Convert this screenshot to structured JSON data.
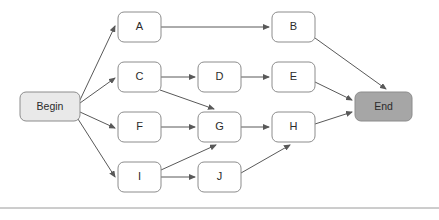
{
  "diagram": {
    "background_color": "#ffffff",
    "divider": {
      "name": "bottom-divider",
      "color": "#9a9a9a",
      "y": 208
    },
    "style": {
      "node_stroke": "#8c8c8c",
      "node_fill_default": "#ffffff",
      "node_fill_begin": "#e9e9e9",
      "node_fill_end": "#a6a6a6",
      "edge_color": "#595959",
      "text_color": "#2b2b2b"
    },
    "nodes": [
      {
        "id": "begin",
        "label": "Begin",
        "x": 20,
        "y": 92,
        "w": 60,
        "h": 29,
        "fill": "#e9e9e9"
      },
      {
        "id": "a",
        "label": "A",
        "x": 118,
        "y": 12,
        "w": 43,
        "h": 30,
        "fill": "#ffffff"
      },
      {
        "id": "b",
        "label": "B",
        "x": 272,
        "y": 12,
        "w": 43,
        "h": 30,
        "fill": "#ffffff"
      },
      {
        "id": "c",
        "label": "C",
        "x": 118,
        "y": 62,
        "w": 43,
        "h": 30,
        "fill": "#ffffff"
      },
      {
        "id": "d",
        "label": "D",
        "x": 198,
        "y": 62,
        "w": 43,
        "h": 30,
        "fill": "#ffffff"
      },
      {
        "id": "e",
        "label": "E",
        "x": 272,
        "y": 62,
        "w": 43,
        "h": 30,
        "fill": "#ffffff"
      },
      {
        "id": "f",
        "label": "F",
        "x": 118,
        "y": 112,
        "w": 43,
        "h": 30,
        "fill": "#ffffff"
      },
      {
        "id": "g",
        "label": "G",
        "x": 198,
        "y": 112,
        "w": 43,
        "h": 30,
        "fill": "#ffffff"
      },
      {
        "id": "h",
        "label": "H",
        "x": 272,
        "y": 112,
        "w": 43,
        "h": 30,
        "fill": "#ffffff"
      },
      {
        "id": "i",
        "label": "I",
        "x": 118,
        "y": 162,
        "w": 43,
        "h": 30,
        "fill": "#ffffff"
      },
      {
        "id": "j",
        "label": "J",
        "x": 198,
        "y": 162,
        "w": 43,
        "h": 30,
        "fill": "#ffffff"
      },
      {
        "id": "end",
        "label": "End",
        "x": 355,
        "y": 92,
        "w": 57,
        "h": 29,
        "fill": "#a6a6a6"
      }
    ],
    "edges": [
      {
        "from": "begin",
        "to": "a",
        "x1": 80,
        "y1": 100,
        "x2": 115,
        "y2": 26
      },
      {
        "from": "begin",
        "to": "c",
        "x1": 80,
        "y1": 103,
        "x2": 115,
        "y2": 78
      },
      {
        "from": "begin",
        "to": "f",
        "x1": 80,
        "y1": 112,
        "x2": 115,
        "y2": 128
      },
      {
        "from": "begin",
        "to": "i",
        "x1": 78,
        "y1": 119,
        "x2": 115,
        "y2": 177
      },
      {
        "from": "a",
        "to": "b",
        "x1": 161,
        "y1": 27,
        "x2": 269,
        "y2": 27
      },
      {
        "from": "b",
        "to": "end",
        "x1": 315,
        "y1": 38,
        "x2": 386,
        "y2": 89
      },
      {
        "from": "c",
        "to": "d",
        "x1": 161,
        "y1": 77,
        "x2": 195,
        "y2": 77
      },
      {
        "from": "c",
        "to": "g",
        "x1": 160,
        "y1": 90,
        "x2": 214,
        "y2": 109
      },
      {
        "from": "d",
        "to": "e",
        "x1": 241,
        "y1": 77,
        "x2": 269,
        "y2": 77
      },
      {
        "from": "e",
        "to": "end",
        "x1": 315,
        "y1": 82,
        "x2": 352,
        "y2": 100
      },
      {
        "from": "f",
        "to": "g",
        "x1": 161,
        "y1": 127,
        "x2": 195,
        "y2": 127
      },
      {
        "from": "g",
        "to": "h",
        "x1": 241,
        "y1": 127,
        "x2": 269,
        "y2": 127
      },
      {
        "from": "h",
        "to": "end",
        "x1": 315,
        "y1": 124,
        "x2": 352,
        "y2": 112
      },
      {
        "from": "i",
        "to": "g",
        "x1": 161,
        "y1": 170,
        "x2": 216,
        "y2": 145
      },
      {
        "from": "i",
        "to": "j",
        "x1": 161,
        "y1": 177,
        "x2": 195,
        "y2": 177
      },
      {
        "from": "j",
        "to": "h",
        "x1": 241,
        "y1": 173,
        "x2": 290,
        "y2": 145
      }
    ]
  }
}
